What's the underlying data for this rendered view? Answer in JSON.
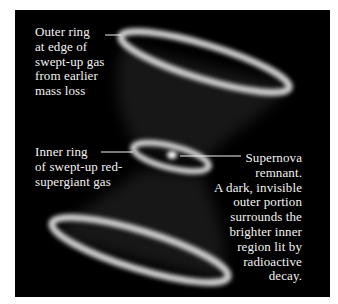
{
  "figure": {
    "background_color": "#000000",
    "page_color": "#ffffff",
    "ring_color": "#d8d8d8",
    "text_color": "#f2f2f2"
  },
  "labels": {
    "outer_ring": {
      "lines": [
        "Outer ring",
        "at edge of",
        "swept-up gas",
        "from earlier",
        "mass loss"
      ]
    },
    "inner_ring": {
      "lines": [
        "Inner ring",
        "of swept-up red-",
        "supergiant gas"
      ]
    },
    "remnant": {
      "lines": [
        "Supernova",
        "remnant.",
        "A dark, invisible",
        "outer portion",
        "surrounds the",
        "brighter inner",
        "region lit by",
        "radioactive",
        "decay."
      ]
    }
  }
}
